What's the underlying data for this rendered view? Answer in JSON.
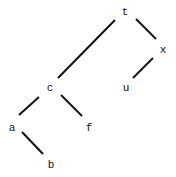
{
  "tree": {
    "nodes": [
      {
        "id": "t",
        "label": "t",
        "x": 125,
        "y": 12
      },
      {
        "id": "x",
        "label": "x",
        "x": 163,
        "y": 50
      },
      {
        "id": "u",
        "label": "u",
        "x": 126,
        "y": 88
      },
      {
        "id": "c",
        "label": "c",
        "x": 50,
        "y": 88
      },
      {
        "id": "f",
        "label": "f",
        "x": 89,
        "y": 128
      },
      {
        "id": "a",
        "label": "a",
        "x": 12,
        "y": 128
      },
      {
        "id": "b",
        "label": "b",
        "x": 51,
        "y": 165
      }
    ],
    "edges": [
      {
        "from": "t",
        "to": "c"
      },
      {
        "from": "t",
        "to": "x"
      },
      {
        "from": "x",
        "to": "u"
      },
      {
        "from": "c",
        "to": "a"
      },
      {
        "from": "c",
        "to": "f"
      },
      {
        "from": "a",
        "to": "b"
      }
    ]
  }
}
